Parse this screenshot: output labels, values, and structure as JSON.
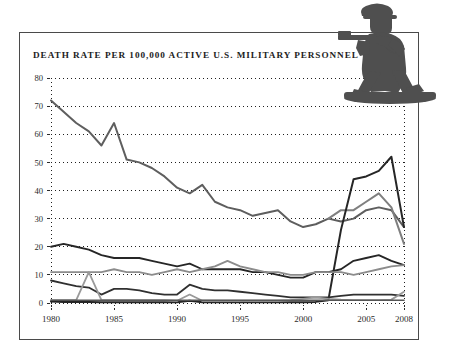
{
  "figure": {
    "title": "DEATH RATE PER 100,000 ACTIVE U.S. MILITARY PERSONNEL",
    "soldier_icon": "toy-soldier-icon",
    "border_color": "#4a4a4a",
    "background": "#ffffff"
  },
  "chart_data": {
    "type": "line",
    "title": "DEATH RATE PER 100,000 ACTIVE U.S. MILITARY PERSONNEL",
    "xlabel": "",
    "ylabel": "",
    "xlim": [
      1980,
      2008
    ],
    "ylim": [
      0,
      80
    ],
    "yticks": [
      0,
      10,
      20,
      30,
      40,
      50,
      60,
      70,
      80
    ],
    "ytick_labels": [
      "0",
      "10",
      "20",
      "30",
      "40",
      "50",
      "60",
      "70",
      "80"
    ],
    "xticks": [
      1980,
      1985,
      1990,
      1995,
      2000,
      2005,
      2008
    ],
    "xtick_labels": [
      "1980",
      "1985",
      "1990",
      "1995",
      "2000",
      "2005",
      "2008"
    ],
    "grid": "horizontal-dotted",
    "legend": "none",
    "x": [
      1980,
      1981,
      1982,
      1983,
      1984,
      1985,
      1986,
      1987,
      1988,
      1989,
      1990,
      1991,
      1992,
      1993,
      1994,
      1995,
      1996,
      1997,
      1998,
      1999,
      2000,
      2001,
      2002,
      2003,
      2004,
      2005,
      2006,
      2007,
      2008
    ],
    "series": [
      {
        "name": "Total death rate",
        "color": "#5e5e5e",
        "width": 2.0,
        "values": [
          72,
          68,
          64,
          61,
          56,
          64,
          51,
          50,
          48,
          45,
          41,
          39,
          42,
          36,
          34,
          33,
          31,
          32,
          33,
          29,
          27,
          28,
          30,
          29,
          30,
          33,
          34,
          33,
          27
        ]
      },
      {
        "name": "Accident deaths",
        "color": "#7f7f7f",
        "width": 2.0,
        "values": [
          null,
          null,
          null,
          null,
          null,
          null,
          null,
          null,
          null,
          null,
          null,
          null,
          null,
          null,
          null,
          null,
          null,
          null,
          null,
          null,
          null,
          null,
          30,
          33,
          33,
          36,
          39,
          34,
          21
        ]
      },
      {
        "name": "Hostile action deaths",
        "color": "#262626",
        "width": 2.0,
        "values": [
          0.5,
          0.4,
          0.4,
          0.4,
          0.3,
          0.3,
          0.3,
          0.3,
          0.3,
          0.3,
          0.3,
          0.8,
          0.3,
          0.3,
          0.3,
          0.3,
          0.3,
          0.3,
          0.3,
          0.3,
          0.3,
          0.4,
          1.0,
          26,
          44,
          45,
          47,
          52,
          27
        ]
      },
      {
        "name": "Illness deaths",
        "color": "#262626",
        "width": 1.8,
        "values": [
          20,
          21,
          20,
          19,
          17,
          16,
          16,
          16,
          15,
          14,
          13,
          14,
          12,
          12,
          12,
          12,
          11,
          11,
          10,
          9,
          9,
          11,
          11,
          12,
          15,
          16,
          17,
          15,
          13.5
        ]
      },
      {
        "name": "Self-inflicted deaths",
        "color": "#8c8c8c",
        "width": 1.8,
        "values": [
          11,
          11,
          11,
          11,
          11,
          12,
          11,
          11,
          10,
          11,
          12,
          11,
          12,
          13,
          15,
          13,
          12,
          11,
          11,
          10,
          10,
          11,
          11,
          11,
          10,
          11,
          12,
          13,
          13.5
        ]
      },
      {
        "name": "Homicide deaths",
        "color": "#303030",
        "width": 1.8,
        "values": [
          8,
          7,
          6,
          5.5,
          3,
          5,
          5,
          4.5,
          3.5,
          3,
          3,
          6.5,
          5,
          4.5,
          4.5,
          4,
          3.5,
          3,
          2.5,
          2,
          2,
          2,
          2,
          2.5,
          3,
          3,
          3,
          3,
          2.5
        ]
      },
      {
        "name": "Other deaths",
        "color": "#9a9a9a",
        "width": 1.8,
        "values": [
          1,
          1,
          1,
          11,
          1,
          1,
          1,
          1,
          1,
          1,
          0.8,
          3,
          0.8,
          0.8,
          0.8,
          0.8,
          0.8,
          0.8,
          0.8,
          1,
          1.5,
          2,
          1.5,
          1.2,
          1,
          1,
          1,
          1.2,
          4
        ]
      },
      {
        "name": "Baseline",
        "color": "#555555",
        "width": 1.6,
        "values": [
          1,
          1,
          1,
          1,
          1,
          1,
          1,
          1,
          1,
          1,
          1,
          1,
          1,
          1,
          1,
          1,
          1,
          1,
          1,
          1,
          1,
          1,
          1,
          1,
          1,
          1,
          1,
          1,
          1
        ]
      }
    ]
  },
  "plot_geometry": {
    "left": 51,
    "right": 404,
    "top": 78,
    "bottom": 303
  }
}
